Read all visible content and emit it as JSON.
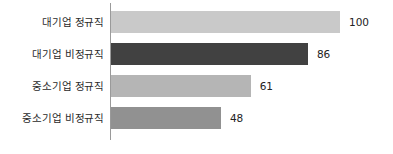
{
  "chart_data": {
    "type": "bar",
    "orientation": "horizontal",
    "title": "",
    "subtitle": "",
    "xlabel": "",
    "ylabel": "",
    "categories": [
      "대기업 정규직",
      "대기업 비정규직",
      "중소기업 정규직",
      "중소기업 비정규직"
    ],
    "values": [
      100,
      86,
      61,
      48
    ],
    "value_labels": [
      "100",
      "86",
      "61",
      "48"
    ],
    "bar_colors": [
      "#c9c9c9",
      "#414141",
      "#b5b5b5",
      "#919191"
    ],
    "xlim": [
      0,
      100
    ],
    "grid": false,
    "legend": null,
    "axis_line_color": "#9a9a9a",
    "background": "#ffffff",
    "bars": [
      {
        "category": "대기업 정규직",
        "value": 100,
        "label": "100",
        "color": "#c9c9c9"
      },
      {
        "category": "대기업 비정규직",
        "value": 86,
        "label": "86",
        "color": "#414141"
      },
      {
        "category": "중소기업 정규직",
        "value": 61,
        "label": "61",
        "color": "#b5b5b5"
      },
      {
        "category": "중소기업 비정규직",
        "value": 48,
        "label": "48",
        "color": "#919191"
      }
    ]
  }
}
